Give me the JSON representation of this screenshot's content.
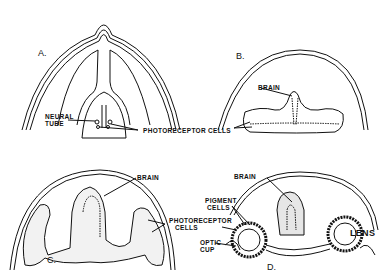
{
  "diagram": {
    "panels": [
      {
        "id": "A",
        "label": "A.",
        "labels": [
          "NEURAL",
          "TUBE"
        ]
      },
      {
        "id": "B",
        "label": "B.",
        "labels": [
          "BRAIN"
        ]
      },
      {
        "id": "C",
        "label": "C.",
        "labels": [
          "BRAIN",
          "PHOTORECEPTOR",
          "CELLS"
        ]
      },
      {
        "id": "D",
        "label": "D.",
        "labels": [
          "BRAIN",
          "PIGMENT",
          "CELLS",
          "OPTIC",
          "CUP",
          "LENS"
        ]
      }
    ],
    "shared_labels": {
      "photoreceptor_cells": "PHOTORECEPTOR  CELLS"
    },
    "colors": {
      "line": "#111111",
      "shading": "#e6e6e6",
      "background": "#ffffff"
    }
  }
}
